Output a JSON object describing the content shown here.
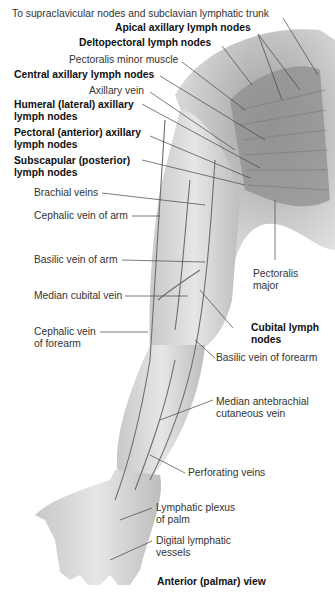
{
  "figure": {
    "view_label": "Anterior (palmar) view",
    "labels": {
      "supraclavicular": "To supraclavicular nodes and subclavian lymphatic trunk",
      "apical": "Apical axillary lymph nodes",
      "deltopectoral": "Deltopectoral lymph nodes",
      "pect_minor": "Pectoralis minor muscle",
      "central": "Central axillary lymph nodes",
      "axillary_vein": "Axillary vein",
      "humeral_1": "Humeral (lateral) axillary",
      "humeral_2": "lymph nodes",
      "pectoral_1": "Pectoral (anterior) axillary",
      "pectoral_2": "lymph nodes",
      "subscap_1": "Subscapular (posterior)",
      "subscap_2": "lymph nodes",
      "brachial": "Brachial veins",
      "cephalic_arm": "Cephalic vein of arm",
      "basilic_arm": "Basilic vein of arm",
      "median_cubital": "Median cubital vein",
      "cephalic_forearm_1": "Cephalic vein",
      "cephalic_forearm_2": "of forearm",
      "pect_major_1": "Pectoralis",
      "pect_major_2": "major",
      "cubital_1": "Cubital lymph",
      "cubital_2": "nodes",
      "basilic_forearm": "Basilic vein of forearm",
      "median_ante_1": "Median antebrachial",
      "median_ante_2": "cutaneous vein",
      "perforating": "Perforating veins",
      "plexus_1": "Lymphatic plexus",
      "plexus_2": "of palm",
      "digital_1": "Digital lymphatic",
      "digital_2": "vessels"
    },
    "colors": {
      "skin": "#d9d9d9",
      "muscle": "#9a9a9a",
      "vessel": "#6e6e6e",
      "leader": "#444444"
    }
  }
}
